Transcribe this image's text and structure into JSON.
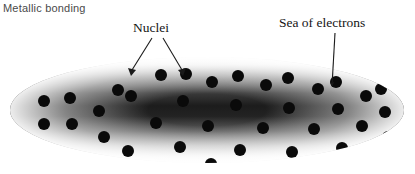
{
  "figure": {
    "title": "Metallic bonding",
    "width": 415,
    "height": 174,
    "background_color": "#ffffff"
  },
  "annotations": {
    "nuclei": {
      "label": "Nuclei",
      "leader_lines": 2,
      "points_to": "black-dots"
    },
    "sea_of_electrons": {
      "label": "Sea of electrons",
      "leader_lines": 1,
      "arrowhead": true,
      "points_to": "gray-gradient-region"
    }
  },
  "diagram": {
    "shape": "ellipse",
    "cx": 207,
    "cy": 110,
    "rx": 197,
    "ry": 53,
    "gradient": {
      "type": "vertical-band",
      "edge_color": "#f2f2f2",
      "mid_light_color": "#d8d8d8",
      "core_color": "#1e1e1e",
      "description": "light at top and bottom edges, darkest through the horizontal middle band"
    },
    "nuclei_color": "#0a0a0a",
    "nucleus_radius": 6,
    "nuclei_count": 40,
    "nuclei_positions": [
      [
        44,
        101
      ],
      [
        70,
        98
      ],
      [
        44,
        124
      ],
      [
        72,
        124
      ],
      [
        99,
        111
      ],
      [
        104,
        137
      ],
      [
        131,
        96
      ],
      [
        128,
        151
      ],
      [
        156,
        123
      ],
      [
        161,
        75
      ],
      [
        160,
        169
      ],
      [
        183,
        101
      ],
      [
        180,
        147
      ],
      [
        186,
        74
      ],
      [
        208,
        126
      ],
      [
        212,
        82
      ],
      [
        211,
        164
      ],
      [
        236,
        105
      ],
      [
        240,
        150
      ],
      [
        238,
        76
      ],
      [
        263,
        128
      ],
      [
        266,
        85
      ],
      [
        262,
        169
      ],
      [
        289,
        108
      ],
      [
        292,
        152
      ],
      [
        288,
        78
      ],
      [
        314,
        129
      ],
      [
        318,
        89
      ],
      [
        313,
        163
      ],
      [
        338,
        109
      ],
      [
        342,
        148
      ],
      [
        336,
        82
      ],
      [
        362,
        126
      ],
      [
        366,
        96
      ],
      [
        360,
        156
      ],
      [
        385,
        112
      ],
      [
        388,
        137
      ],
      [
        381,
        89
      ],
      [
        118,
        90
      ],
      [
        95,
        166
      ]
    ]
  }
}
